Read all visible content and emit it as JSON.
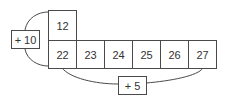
{
  "diagram": {
    "top_cell": "12",
    "row_cells": [
      "22",
      "23",
      "24",
      "25",
      "26",
      "27"
    ],
    "operators": {
      "left": "+ 10",
      "bottom": "+ 5"
    },
    "line_color": "#4a4a4a"
  }
}
